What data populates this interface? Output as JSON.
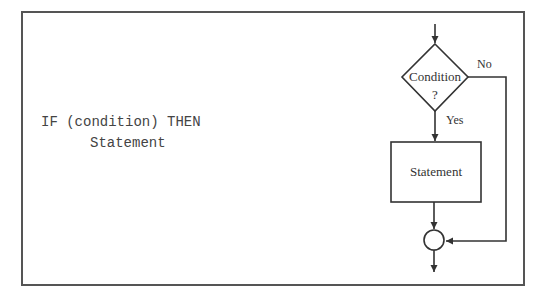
{
  "pseudocode": {
    "line1": "IF (condition) THEN",
    "line2": "Statement"
  },
  "flowchart": {
    "decision": {
      "label_line1": "Condition",
      "label_line2": "?"
    },
    "yes_label": "Yes",
    "no_label": "No",
    "process": {
      "label": "Statement"
    },
    "stroke_color": "#333333"
  }
}
